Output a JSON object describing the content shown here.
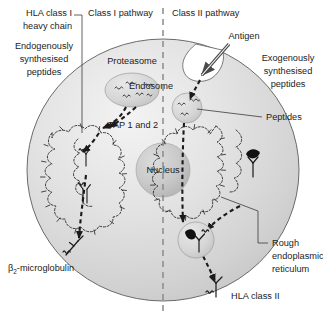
{
  "figure": {
    "background_color": "#ffffff",
    "cell_fill_color": "#d8d8d8",
    "cell_stroke_color": "#5a5a5a",
    "nucleus_color": "#c2c2c2",
    "organelle_color": "#cfcfcf",
    "text_color": "#1c1c1c"
  },
  "headers": {
    "left_pathway": "Class I pathway",
    "right_pathway": "Class II pathway"
  },
  "labels": {
    "hla_class_i_line1": "HLA class I",
    "hla_class_i_line2": "heavy chain",
    "endogenous_line1": "Endogenously",
    "endogenous_line2": "synthesised",
    "endogenous_line3": "peptides",
    "proteasome": "Proteasome",
    "tap": "TAP 1 and 2",
    "nucleus": "Nucleus",
    "beta2_microglobulin_prefix": "β",
    "beta2_microglobulin_sub": "2",
    "beta2_microglobulin_suffix": "-microglobulin",
    "antigen": "Antigen",
    "endosome": "Endosome",
    "exogenous_line1": "Exogenously",
    "exogenous_line2": "synthesised",
    "exogenous_line3": "peptides",
    "peptides": "Peptides",
    "rough_er_line1": "Rough",
    "rough_er_line2": "endoplasmic",
    "rough_er_line3": "reticulum",
    "hla_class_ii": "HLA class II"
  },
  "diagram_elements": {
    "cell": {
      "name": "antigen-presenting-cell",
      "center_x": 163,
      "center_y": 170,
      "radius_x": 136,
      "radius_y": 131
    },
    "nucleus": {
      "center_x": 163,
      "center_y": 170,
      "radius": 27
    },
    "proteasome": {
      "center_x": 132,
      "center_y": 90,
      "radius_x": 27,
      "radius_y": 17
    },
    "endosome": {
      "center_x": 187,
      "center_y": 108,
      "radius": 15
    },
    "loading_vesicle": {
      "center_x": 196,
      "center_y": 240,
      "radius": 18
    },
    "divider": {
      "x": 163,
      "y_top": 8,
      "y_bottom": 310,
      "style": "dashed"
    }
  }
}
